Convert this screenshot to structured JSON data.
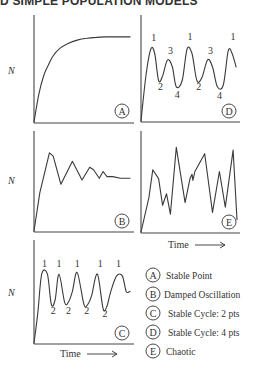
{
  "header": {
    "title": "D SIMPLE POPULATION MODELS"
  },
  "chart_data": [
    {
      "id": "A",
      "type": "line",
      "ylabel": "N",
      "xlabel": "",
      "badge": "A",
      "x": [
        0,
        0.05,
        0.1,
        0.15,
        0.2,
        0.27,
        0.35,
        0.45,
        0.55,
        0.65,
        0.75,
        0.85,
        1.0
      ],
      "y": [
        0,
        0.3,
        0.5,
        0.62,
        0.72,
        0.8,
        0.85,
        0.89,
        0.91,
        0.92,
        0.925,
        0.925,
        0.925
      ],
      "peak_labels": []
    },
    {
      "id": "B",
      "type": "line",
      "ylabel": "N",
      "xlabel": "",
      "badge": "B",
      "x": [
        0,
        0.06,
        0.16,
        0.2,
        0.28,
        0.4,
        0.5,
        0.58,
        0.62,
        0.68,
        0.72,
        0.76,
        0.82,
        0.9,
        1.0
      ],
      "y": [
        0,
        0.45,
        0.92,
        0.88,
        0.55,
        0.82,
        0.6,
        0.75,
        0.72,
        0.62,
        0.7,
        0.64,
        0.64,
        0.62,
        0.62
      ],
      "peak_labels": []
    },
    {
      "id": "C",
      "type": "line",
      "ylabel": "N",
      "xlabel": "Time",
      "badge": "C",
      "x": [
        0,
        0.04,
        0.08,
        0.14,
        0.18,
        0.22,
        0.26,
        0.32,
        0.36,
        0.4,
        0.45,
        0.52,
        0.56,
        0.6,
        0.66,
        0.72,
        0.76,
        0.8,
        0.86,
        0.92,
        0.96,
        1.0
      ],
      "y": [
        0,
        0.35,
        0.8,
        0.8,
        0.45,
        0.5,
        0.8,
        0.47,
        0.48,
        0.6,
        0.82,
        0.45,
        0.45,
        0.55,
        0.8,
        0.4,
        0.43,
        0.6,
        0.78,
        0.78,
        0.6,
        0.6
      ],
      "peak_labels": [
        {
          "text": "1",
          "x": 0.11,
          "y": 0.88
        },
        {
          "text": "1",
          "x": 0.26,
          "y": 0.88
        },
        {
          "text": "1",
          "x": 0.45,
          "y": 0.88
        },
        {
          "text": "1",
          "x": 0.69,
          "y": 0.88
        },
        {
          "text": "1",
          "x": 0.88,
          "y": 0.88
        },
        {
          "text": "2",
          "x": 0.2,
          "y": 0.34
        },
        {
          "text": "2",
          "x": 0.36,
          "y": 0.34
        },
        {
          "text": "2",
          "x": 0.55,
          "y": 0.34
        },
        {
          "text": "2",
          "x": 0.74,
          "y": 0.3
        }
      ]
    },
    {
      "id": "D",
      "type": "line",
      "ylabel": "",
      "xlabel": "",
      "badge": "D",
      "x": [
        0,
        0.05,
        0.1,
        0.14,
        0.18,
        0.22,
        0.27,
        0.32,
        0.36,
        0.42,
        0.47,
        0.52,
        0.57,
        0.62,
        0.68,
        0.73,
        0.78,
        0.84,
        0.89,
        0.93,
        0.97
      ],
      "y": [
        0,
        0.5,
        0.8,
        0.75,
        0.45,
        0.5,
        0.68,
        0.6,
        0.38,
        0.45,
        0.8,
        0.75,
        0.45,
        0.48,
        0.68,
        0.6,
        0.38,
        0.4,
        0.78,
        0.75,
        0.6
      ],
      "peak_labels": [
        {
          "text": "1",
          "x": 0.13,
          "y": 0.89
        },
        {
          "text": "3",
          "x": 0.3,
          "y": 0.75
        },
        {
          "text": "1",
          "x": 0.5,
          "y": 0.9
        },
        {
          "text": "3",
          "x": 0.71,
          "y": 0.75
        },
        {
          "text": "1",
          "x": 0.94,
          "y": 0.9
        },
        {
          "text": "2",
          "x": 0.2,
          "y": 0.35
        },
        {
          "text": "4",
          "x": 0.37,
          "y": 0.26
        },
        {
          "text": "2",
          "x": 0.59,
          "y": 0.35
        },
        {
          "text": "4",
          "x": 0.8,
          "y": 0.24
        }
      ]
    },
    {
      "id": "E",
      "type": "line",
      "ylabel": "",
      "xlabel": "Time",
      "badge": "E",
      "x": [
        0,
        0.08,
        0.12,
        0.18,
        0.22,
        0.26,
        0.3,
        0.36,
        0.45,
        0.5,
        0.52,
        0.53,
        0.55,
        0.65,
        0.73,
        0.8,
        0.86,
        0.94,
        0.98
      ],
      "y": [
        0,
        0.38,
        0.7,
        0.6,
        0.3,
        0.43,
        0.2,
        0.95,
        0.33,
        0.6,
        0.65,
        0.58,
        0.68,
        0.88,
        0.22,
        0.68,
        0.28,
        0.92,
        0.14
      ],
      "peak_labels": []
    }
  ],
  "legend": [
    {
      "badge": "A",
      "label": "Stable Point"
    },
    {
      "badge": "B",
      "label": "Damped Oscillation"
    },
    {
      "badge": "C",
      "label": "Stable Cycle: 2 pts"
    },
    {
      "badge": "D",
      "label": "Stable Cycle: 4 pts"
    },
    {
      "badge": "E",
      "label": "Chaotic"
    }
  ],
  "time_arrow": "→"
}
